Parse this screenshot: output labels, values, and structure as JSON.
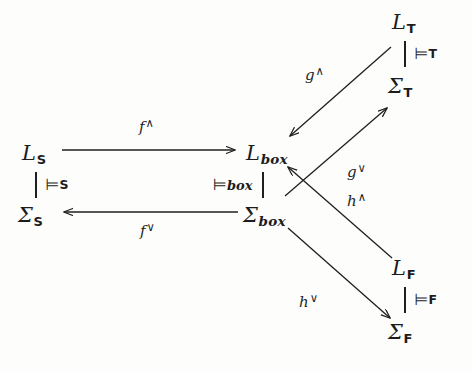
{
  "diagram": {
    "nodes": [
      {
        "id": "L_S",
        "base": "L",
        "sub": "S",
        "sub_style": "bold",
        "x": 22,
        "y": 143
      },
      {
        "id": "Sigma_S",
        "base": "Σ",
        "sub": "S",
        "sub_style": "bold",
        "x": 18,
        "y": 205
      },
      {
        "id": "L_box",
        "base": "L",
        "sub": "box",
        "sub_style": "italic",
        "x": 246,
        "y": 143
      },
      {
        "id": "Sigma_box",
        "base": "Σ",
        "sub": "box",
        "sub_style": "italic",
        "x": 243,
        "y": 205
      },
      {
        "id": "L_T",
        "base": "L",
        "sub": "T",
        "sub_style": "bold",
        "x": 392,
        "y": 12
      },
      {
        "id": "Sigma_T",
        "base": "Σ",
        "sub": "T",
        "sub_style": "bold",
        "x": 388,
        "y": 76
      },
      {
        "id": "L_F",
        "base": "L",
        "sub": "F",
        "sub_style": "bold",
        "x": 392,
        "y": 258
      },
      {
        "id": "Sigma_F",
        "base": "Σ",
        "sub": "F",
        "sub_style": "bold",
        "x": 388,
        "y": 322
      }
    ],
    "entailments": [
      {
        "id": "ent_S",
        "bar_side": "left",
        "symbol": "⊨",
        "sub": "S",
        "sub_style": "bold",
        "x": 35,
        "y": 172
      },
      {
        "id": "ent_box",
        "bar_side": "right",
        "symbol": "⊨",
        "sub": "box",
        "sub_style": "italic",
        "x": 213,
        "y": 172
      },
      {
        "id": "ent_T",
        "bar_side": "left",
        "symbol": "⊨",
        "sub": "T",
        "sub_style": "bold",
        "x": 404,
        "y": 41
      },
      {
        "id": "ent_F",
        "bar_side": "left",
        "symbol": "⊨",
        "sub": "F",
        "sub_style": "bold",
        "x": 404,
        "y": 287
      }
    ],
    "arrow_labels": [
      {
        "id": "f_up",
        "base": "f",
        "sup": "∧",
        "x": 139,
        "y": 118
      },
      {
        "id": "f_down",
        "base": "f",
        "sup": "∨",
        "x": 140,
        "y": 222
      },
      {
        "id": "g_up",
        "base": "g",
        "sup": "∧",
        "x": 305,
        "y": 66
      },
      {
        "id": "g_down",
        "base": "g",
        "sup": "∨",
        "x": 347,
        "y": 163
      },
      {
        "id": "h_up",
        "base": "h",
        "sup": "∧",
        "x": 347,
        "y": 192
      },
      {
        "id": "h_down",
        "base": "h",
        "sup": "∨",
        "x": 299,
        "y": 293
      }
    ],
    "arrows": [
      {
        "id": "arrow_f_up",
        "from": "L_S",
        "to": "L_box",
        "x1": 62,
        "y1": 150,
        "x2": 235,
        "y2": 150
      },
      {
        "id": "arrow_f_down",
        "from": "Sigma_box",
        "to": "Sigma_S",
        "x1": 238,
        "y1": 212,
        "x2": 64,
        "y2": 212
      },
      {
        "id": "arrow_g_up",
        "from": "L_T",
        "to": "L_box",
        "x1": 391,
        "y1": 47,
        "x2": 290,
        "y2": 136
      },
      {
        "id": "arrow_g_down",
        "from": "Sigma_box",
        "to": "Sigma_T",
        "x1": 285,
        "y1": 196,
        "x2": 387,
        "y2": 108
      },
      {
        "id": "arrow_h_up",
        "from": "L_F",
        "to": "L_box",
        "x1": 392,
        "y1": 258,
        "x2": 288,
        "y2": 167
      },
      {
        "id": "arrow_h_down",
        "from": "Sigma_box",
        "to": "Sigma_F",
        "x1": 288,
        "y1": 228,
        "x2": 390,
        "y2": 318
      }
    ],
    "colors": {
      "ink": "#1c1c1c",
      "background": "#fdfdfc"
    }
  }
}
